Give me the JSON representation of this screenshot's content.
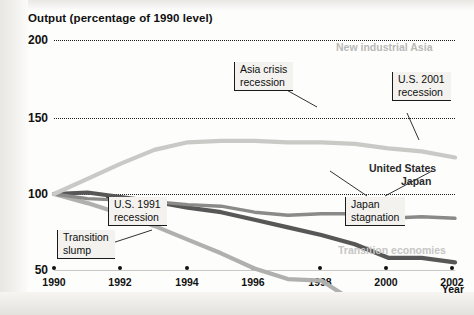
{
  "figure": {
    "title": "Output (percentage of 1990 level)",
    "xaxis_title": "Year"
  },
  "labels": {
    "new_industrial_asia": "New industrial Asia",
    "united_states": "United States",
    "japan": "Japan",
    "transition_economies": "Transition economies"
  },
  "callouts": {
    "asia_crisis": "Asia crisis\nrecession",
    "us_2001": "U.S. 2001\nrecession",
    "us_1991": "U.S. 1991\nrecession",
    "japan_stagnation": "Japan\nstagnation",
    "transition_slump": "Transition\nslump"
  },
  "colors": {
    "new_industrial_asia": "#b0b0ae",
    "united_states": "#575757",
    "japan": "#8a8a88",
    "transition_economies": "#c9c9c6",
    "grid": "#1b1b1b",
    "text": "#101010"
  },
  "chart_data": {
    "type": "line",
    "title": "Output (percentage of 1990 level)",
    "xlabel": "Year",
    "ylabel": "Output (percentage of 1990 level)",
    "xlim": [
      1990,
      2002
    ],
    "ylim": [
      50,
      200
    ],
    "yticks": [
      50,
      100,
      150,
      200
    ],
    "xticks": [
      1990,
      1992,
      1994,
      1996,
      1998,
      2000,
      2002
    ],
    "grid": "horizontal-dotted",
    "legend": "inline-labels",
    "x": [
      1990,
      1991,
      1992,
      1993,
      1994,
      1995,
      1996,
      1997,
      1998,
      1999,
      2000,
      2001,
      2002
    ],
    "series": [
      {
        "name": "New industrial Asia",
        "color": "#b0b0ae",
        "values": [
          100,
          106,
          113,
          121,
          130,
          139,
          149,
          156,
          157,
          171,
          182,
          184,
          190
        ]
      },
      {
        "name": "United States",
        "color": "#575757",
        "values": [
          100,
          99,
          102,
          105,
          109,
          112,
          117,
          122,
          127,
          133,
          142,
          142,
          145
        ]
      },
      {
        "name": "Japan",
        "color": "#8a8a88",
        "values": [
          100,
          103,
          104,
          105,
          107,
          108,
          112,
          114,
          113,
          113,
          116,
          115,
          116
        ]
      },
      {
        "name": "Transition economies",
        "color": "#c9c9c6",
        "values": [
          100,
          90,
          80,
          71,
          66,
          65,
          65,
          66,
          66,
          67,
          70,
          72,
          76
        ]
      }
    ],
    "annotations": [
      {
        "text": "Asia crisis recession",
        "series": "New industrial Asia",
        "year": 1998
      },
      {
        "text": "U.S. 2001 recession",
        "series": "United States",
        "year": 2001
      },
      {
        "text": "U.S. 1991 recession",
        "series": "United States",
        "year": 1991
      },
      {
        "text": "Japan stagnation",
        "series": "Japan",
        "year": 1998
      },
      {
        "text": "Transition slump",
        "series": "Transition economies",
        "year": 1993
      }
    ]
  }
}
